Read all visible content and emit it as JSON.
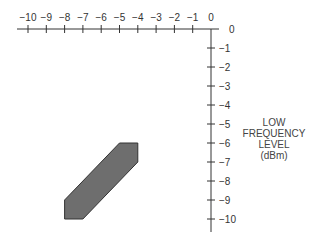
{
  "chart_data": {
    "type": "area",
    "title": "",
    "x_axis": {
      "position": "top",
      "ticks": [
        -10,
        -9,
        -8,
        -7,
        -6,
        -5,
        -4,
        -3,
        -2,
        -1,
        0
      ],
      "tick_labels": [
        "−10",
        "−9",
        "−8",
        "−7",
        "−6",
        "−5",
        "−4",
        "−3",
        "−2",
        "−1",
        "0"
      ],
      "range": [
        -10,
        0
      ],
      "xlabel": ""
    },
    "y_axis": {
      "position": "right",
      "ticks": [
        0,
        -1,
        -2,
        -3,
        -4,
        -5,
        -6,
        -7,
        -8,
        -9,
        -10
      ],
      "tick_labels": [
        "0",
        "−1",
        "−2",
        "−3",
        "−4",
        "−5",
        "−6",
        "−7",
        "−8",
        "−9",
        "−10"
      ],
      "range": [
        -10,
        0
      ],
      "ylabel_lines": [
        "LOW",
        "FREQUENCY",
        "LEVEL",
        "(dBm)"
      ]
    },
    "region": {
      "name": "shaded-operating-region",
      "fill": "#6e6e6e",
      "stroke": "#333333",
      "vertices": [
        [
          -5,
          -6
        ],
        [
          -4,
          -6
        ],
        [
          -4,
          -7
        ],
        [
          -7,
          -10
        ],
        [
          -8,
          -10
        ],
        [
          -8,
          -9
        ]
      ]
    },
    "grid": false
  }
}
